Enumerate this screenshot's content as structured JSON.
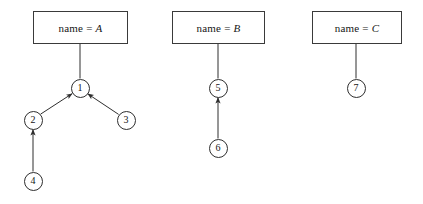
{
  "figure": {
    "type": "object-graph-diagram",
    "background_color": "#ffffff",
    "stroke_color": "#2e2e2e",
    "width": 423,
    "height": 204
  },
  "groups": [
    {
      "id": "group-a",
      "label_prefix": "name =",
      "label_value": "A",
      "box": {
        "x": 33,
        "y": 11,
        "w": 95,
        "h": 33
      },
      "root_node": "1"
    },
    {
      "id": "group-b",
      "label_prefix": "name =",
      "label_value": "B",
      "box": {
        "x": 172,
        "y": 11,
        "w": 93,
        "h": 33
      },
      "root_node": "5"
    },
    {
      "id": "group-c",
      "label_prefix": "name =",
      "label_value": "C",
      "box": {
        "x": 312,
        "y": 11,
        "w": 90,
        "h": 33
      },
      "root_node": "7"
    }
  ],
  "nodes": [
    {
      "id": "1",
      "label": "1",
      "cx": 80,
      "cy": 88,
      "r": 9.5
    },
    {
      "id": "2",
      "label": "2",
      "cx": 33,
      "cy": 120,
      "r": 9.5
    },
    {
      "id": "3",
      "label": "3",
      "cx": 126,
      "cy": 120,
      "r": 9.5
    },
    {
      "id": "4",
      "label": "4",
      "cx": 33,
      "cy": 181,
      "r": 9.5
    },
    {
      "id": "5",
      "label": "5",
      "cx": 218,
      "cy": 88,
      "r": 9.5
    },
    {
      "id": "6",
      "label": "6",
      "cx": 218,
      "cy": 148,
      "r": 9.5
    },
    {
      "id": "7",
      "label": "7",
      "cx": 356,
      "cy": 88,
      "r": 9.5
    }
  ],
  "connectors": [
    {
      "id": "box-a-to-1",
      "from": "group-a",
      "to": "1",
      "arrow": false,
      "x1": 80,
      "y1": 44,
      "x2": 80,
      "y2": 78.5
    },
    {
      "id": "box-b-to-5",
      "from": "group-b",
      "to": "5",
      "arrow": false,
      "x1": 218,
      "y1": 44,
      "x2": 218,
      "y2": 78.5
    },
    {
      "id": "box-c-to-7",
      "from": "group-c",
      "to": "7",
      "arrow": false,
      "x1": 356,
      "y1": 44,
      "x2": 356,
      "y2": 78.5
    }
  ],
  "edges": [
    {
      "id": "edge-2-to-1",
      "from": "2",
      "to": "1",
      "arrow": true,
      "x1": 40.5,
      "y1": 114.2,
      "x2": 72.2,
      "y2": 93.6
    },
    {
      "id": "edge-3-to-1",
      "from": "3",
      "to": "1",
      "arrow": true,
      "x1": 118.6,
      "y1": 114.4,
      "x2": 87.7,
      "y2": 93.8
    },
    {
      "id": "edge-4-to-2",
      "from": "4",
      "to": "2",
      "arrow": true,
      "x1": 33,
      "y1": 171.5,
      "x2": 33,
      "y2": 129.5
    },
    {
      "id": "edge-6-to-5",
      "from": "6",
      "to": "5",
      "arrow": true,
      "x1": 218,
      "y1": 138.5,
      "x2": 218,
      "y2": 97.5
    }
  ]
}
